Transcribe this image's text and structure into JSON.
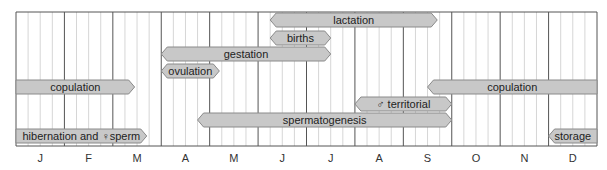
{
  "chart_data": {
    "type": "table",
    "title": "",
    "xlabel": "",
    "ylabel": "",
    "categories": [
      "J",
      "F",
      "M",
      "A",
      "M",
      "J",
      "J",
      "A",
      "S",
      "O",
      "N",
      "D"
    ],
    "grid": true,
    "bar_fill": "#c8c8c8",
    "bar_stroke": "#8a8a8a",
    "series": [
      {
        "name": "lactation",
        "row": 0,
        "start": 5.25,
        "end": 8.7,
        "left": "arrow",
        "right": "arrow"
      },
      {
        "name": "births",
        "row": 1,
        "start": 5.25,
        "end": 6.5,
        "left": "arrow",
        "right": "arrow"
      },
      {
        "name": "gestation",
        "row": 2,
        "start": 3.0,
        "end": 6.5,
        "left": "arrow",
        "right": "arrow"
      },
      {
        "name": "ovulation",
        "row": 3,
        "start": 3.0,
        "end": 4.2,
        "left": "arrow",
        "right": "arrow"
      },
      {
        "name": "copulation",
        "row": 4,
        "start": 0.0,
        "end": 2.45,
        "left": "flat",
        "right": "arrow"
      },
      {
        "name": "copulation",
        "row": 4,
        "start": 8.5,
        "end": 12.0,
        "left": "arrow",
        "right": "flat"
      },
      {
        "name": "♂ territorial",
        "row": 5,
        "start": 7.0,
        "end": 9.0,
        "left": "arrow",
        "right": "arrow"
      },
      {
        "name": "spermatogenesis",
        "row": 6,
        "start": 3.75,
        "end": 9.0,
        "left": "arrow",
        "right": "arrow"
      },
      {
        "name": "hibernation and ♀sperm",
        "row": 7,
        "start": 0.0,
        "end": 2.7,
        "left": "flat",
        "right": "arrow"
      },
      {
        "name": "storage",
        "row": 7,
        "start": 11.0,
        "end": 12.0,
        "left": "arrow",
        "right": "flat"
      }
    ]
  }
}
